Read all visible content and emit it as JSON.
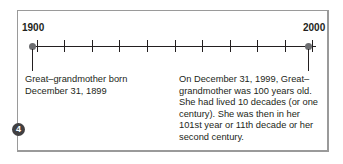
{
  "timeline": {
    "start_year": "1900",
    "end_year": "2000",
    "tick_count": 11,
    "tick_unit": "decade"
  },
  "events": [
    {
      "id": "birth",
      "text_line1": "Great–grandmother born",
      "text_line2": "December 31, 1899"
    },
    {
      "id": "centenary",
      "lines": [
        "On December 31, 1999, Great–",
        "grandmother was 100 years old.",
        "She had lived 10 decades (or one",
        "century). She was then in her",
        "101st year or 11th decade or her",
        "second century."
      ]
    }
  ],
  "badge": {
    "number": "4"
  },
  "colors": {
    "frame": "#9a9a9a",
    "line": "#231f20",
    "dot": "#6d6e71",
    "badge_bg": "#414042",
    "badge_text": "#ffffff"
  }
}
